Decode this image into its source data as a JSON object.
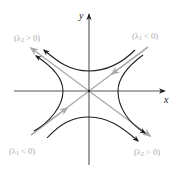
{
  "figure": {
    "title": "",
    "type": "saddle point phase portrait",
    "colors": {
      "axis": "#555555",
      "trajectory": "#1f1f1f",
      "eigenvector": "#a9a9a9",
      "label_gray": "#a9a9a9",
      "axis_label": "#222222"
    }
  },
  "axes": {
    "x_label": "x",
    "y_label": "y"
  },
  "eigen_labels": {
    "top_left": {
      "open": "(λ",
      "sub": "2",
      "rest": " > 0)"
    },
    "top_right": {
      "open": "(λ",
      "sub": "1",
      "rest": " < 0)"
    },
    "bottom_left": {
      "open": "(λ",
      "sub": "1",
      "rest": " < 0)"
    },
    "bottom_right": {
      "open": "(λ",
      "sub": "2",
      "rest": " > 0)"
    }
  },
  "eigenvectors": [
    {
      "name": "stable",
      "direction": "NE-SW",
      "eigenvalue": "λ1 < 0",
      "flow": "inward"
    },
    {
      "name": "unstable",
      "direction": "NW-SE",
      "eigenvalue": "λ2 > 0",
      "flow": "outward"
    }
  ]
}
